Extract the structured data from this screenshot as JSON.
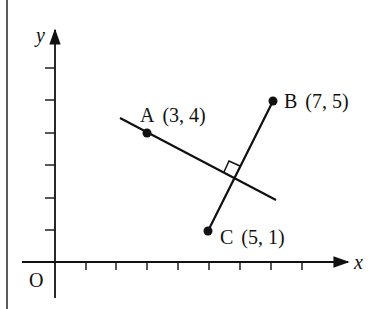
{
  "figure": {
    "axes": {
      "x_label": "x",
      "y_label": "y",
      "origin_label": "O",
      "x_ticks": [
        1,
        2,
        3,
        4,
        5,
        6,
        7,
        8
      ],
      "y_ticks": [
        1,
        2,
        3,
        4,
        5,
        6
      ]
    },
    "points": [
      {
        "name": "A",
        "label": "A",
        "coords": "(3, 4)",
        "x": 3,
        "y": 4
      },
      {
        "name": "B",
        "label": "B",
        "coords": "(7, 5)",
        "x": 7,
        "y": 5
      },
      {
        "name": "C",
        "label": "C",
        "coords": "(5, 1)",
        "x": 5,
        "y": 1
      }
    ],
    "segments": [
      {
        "name": "BC",
        "from": "B",
        "to": "C"
      },
      {
        "name": "line-through-A",
        "description": "line through A perpendicular to BC",
        "right_angle_marker": true
      }
    ],
    "colors": {
      "ink": "#111111",
      "background": "#ffffff"
    }
  }
}
